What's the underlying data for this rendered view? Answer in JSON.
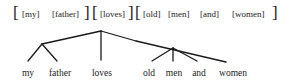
{
  "diagram": {
    "type": "syntax-tree",
    "bracketing": {
      "groups": [
        {
          "name": "subject",
          "items": [
            "[my]",
            "[father]"
          ]
        },
        {
          "name": "verb",
          "items": [
            "[loves]"
          ]
        },
        {
          "name": "object",
          "items": [
            "[old]",
            "[men]",
            "[and]",
            "[women]"
          ]
        }
      ],
      "open_bracket": "[",
      "close_bracket": "]"
    },
    "leaves": [
      "my",
      "father",
      "loves",
      "old",
      "men",
      "and",
      "women"
    ],
    "colors": {
      "ink": "#1a1a1a",
      "background": "#ffffff"
    }
  }
}
